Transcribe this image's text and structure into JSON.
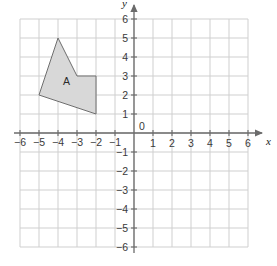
{
  "figure": {
    "title": "",
    "background_color": "#ffffff"
  },
  "chart_data": {
    "type": "scatter",
    "title": "",
    "xlabel": "x",
    "ylabel": "y",
    "xlim": [
      -6,
      6
    ],
    "ylim": [
      -6,
      6
    ],
    "grid": true,
    "legend": null,
    "x_ticks": [
      -6,
      -5,
      -4,
      -3,
      -2,
      -1,
      0,
      1,
      2,
      3,
      4,
      5,
      6
    ],
    "y_ticks": [
      -6,
      -5,
      -4,
      -3,
      -2,
      -1,
      0,
      1,
      2,
      3,
      4,
      5,
      6
    ],
    "x_tick_labels": [
      "−6",
      "−5",
      "−4",
      "−3",
      "−2",
      "−1",
      "0",
      "1",
      "2",
      "3",
      "4",
      "5",
      "6"
    ],
    "y_tick_labels": [
      "−6",
      "−5",
      "−4",
      "−3",
      "−2",
      "−1",
      "0",
      "1",
      "2",
      "3",
      "4",
      "5",
      "6"
    ],
    "origin_label": "0",
    "shapes": [
      {
        "name": "A",
        "label": "A",
        "label_position": [
          -3.55,
          2.55
        ],
        "kind": "polygon",
        "vertices": [
          [
            -4,
            5
          ],
          [
            -3,
            3
          ],
          [
            -2,
            3
          ],
          [
            -2,
            1
          ],
          [
            -5,
            2
          ]
        ],
        "fill": "#d8d8d8",
        "stroke": "#6e6e6e",
        "stroke_width": 1
      }
    ]
  },
  "styles": {
    "grid_color": "#cfcfcf",
    "axis_color": "#6b6b6b",
    "tick_text_color": "#3a3a3a",
    "axis_name_color": "#1a1a1a",
    "shape_fill": "#d8d8d8",
    "shape_stroke": "#6e6e6e"
  },
  "axis_names": {
    "x": "x",
    "y": "y"
  }
}
